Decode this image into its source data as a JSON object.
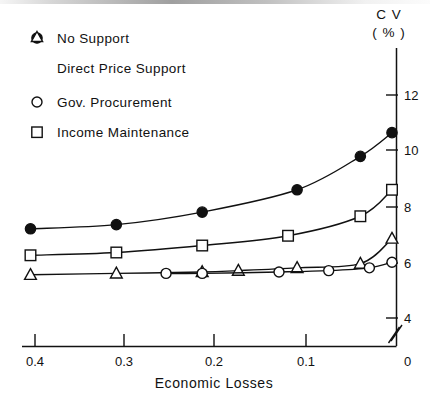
{
  "chart_data": {
    "type": "line",
    "title": "",
    "xlabel": "Economic Losses",
    "ylabel": "CV (%)",
    "ylabel_line1": "C V",
    "ylabel_line2": "( %  )",
    "x_ticks": [
      "0.4",
      "0.3",
      "0.2",
      "0.1",
      "0"
    ],
    "x_tick_values": [
      0.4,
      0.3,
      0.2,
      0.1,
      0
    ],
    "y_ticks": [
      "12",
      "10",
      "8",
      "6",
      "4",
      "0"
    ],
    "y_tick_values": [
      12,
      10,
      8,
      6,
      4,
      0
    ],
    "xlim": [
      0.44,
      0.0
    ],
    "ylim": [
      4,
      13
    ],
    "x_axis_reversed": true,
    "y_axis_break": true,
    "y_axis_break_note": "axis break between 4 and 0",
    "grid": false,
    "legend_position": "top-left",
    "series": [
      {
        "name": "No Support",
        "marker": "filled-circle",
        "x": [
          0.405,
          0.31,
          0.215,
          0.11,
          0.04,
          0.005
        ],
        "values": [
          7.2,
          7.35,
          7.8,
          8.6,
          9.8,
          10.65
        ]
      },
      {
        "name": "Direct Price Support",
        "marker": "open-triangle",
        "x": [
          0.405,
          0.31,
          0.215,
          0.175,
          0.11,
          0.04,
          0.005
        ],
        "values": [
          5.55,
          5.6,
          5.65,
          5.7,
          5.8,
          5.95,
          6.85
        ]
      },
      {
        "name": "Gov. Procurement",
        "marker": "open-circle",
        "x": [
          0.255,
          0.215,
          0.13,
          0.075,
          0.03,
          0.005
        ],
        "values": [
          5.6,
          5.6,
          5.65,
          5.7,
          5.8,
          6.0
        ]
      },
      {
        "name": "Income Maintenance",
        "marker": "open-square",
        "x": [
          0.405,
          0.31,
          0.215,
          0.12,
          0.04,
          0.005
        ],
        "values": [
          6.25,
          6.35,
          6.6,
          6.95,
          7.65,
          8.6
        ]
      }
    ]
  },
  "legend": {
    "items": [
      {
        "marker": "filled-circle",
        "label": "No Support"
      },
      {
        "marker": "open-triangle",
        "label": "Direct Price Support"
      },
      {
        "marker": "open-circle",
        "label": "Gov. Procurement"
      },
      {
        "marker": "open-square",
        "label": "Income Maintenance"
      }
    ]
  },
  "axes": {
    "x_title": "Economic Losses",
    "y_title_line1": "C V",
    "y_title_line2": "( %  )",
    "x_tick_labels": [
      "0.4",
      "0.3",
      "0.2",
      "0.1",
      "0"
    ],
    "y_tick_labels": [
      "12",
      "10",
      "8",
      "6",
      "4",
      "0"
    ]
  },
  "colors": {
    "ink": "#111111",
    "paper": "#ffffff"
  }
}
